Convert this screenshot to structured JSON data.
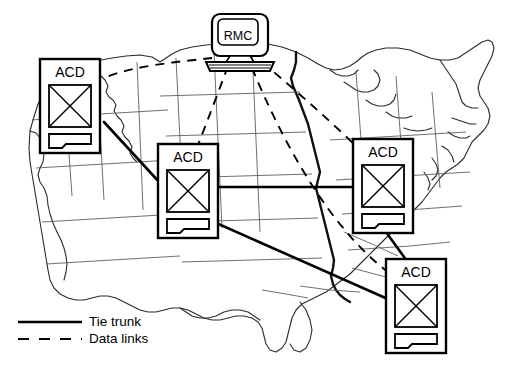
{
  "diagram": {
    "map": {
      "name": "united-states-outline",
      "outline_color": "#1a1a1a",
      "state_border_color": "#3a3a3a",
      "fill": "#ffffff"
    },
    "nodes": [
      {
        "id": "rmc",
        "label": "RMC",
        "type": "computer-workstation",
        "x": 240,
        "y": 40
      },
      {
        "id": "acd-northwest",
        "label": "ACD",
        "type": "acd-switch",
        "x": 70,
        "y": 106
      },
      {
        "id": "acd-central",
        "label": "ACD",
        "type": "acd-switch",
        "x": 188,
        "y": 191
      },
      {
        "id": "acd-northeast",
        "label": "ACD",
        "type": "acd-switch",
        "x": 383,
        "y": 186
      },
      {
        "id": "acd-southeast",
        "label": "ACD",
        "type": "acd-switch",
        "x": 416,
        "y": 306
      }
    ],
    "links": [
      {
        "from": "acd-northwest",
        "to": "acd-central",
        "kind": "tie-trunk"
      },
      {
        "from": "acd-central",
        "to": "acd-northeast",
        "kind": "tie-trunk"
      },
      {
        "from": "acd-central",
        "to": "acd-southeast",
        "kind": "tie-trunk"
      },
      {
        "from": "acd-northeast",
        "to": "acd-southeast",
        "kind": "tie-trunk"
      },
      {
        "from": "rmc",
        "to": "acd-northwest",
        "kind": "data-link"
      },
      {
        "from": "rmc",
        "to": "acd-central",
        "kind": "data-link"
      },
      {
        "from": "rmc",
        "to": "acd-northeast",
        "kind": "data-link"
      },
      {
        "from": "rmc",
        "to": "acd-southeast",
        "kind": "data-link"
      }
    ],
    "legend": {
      "items": [
        {
          "label": "Tie trunk",
          "style": "solid",
          "icon": "solid-line-icon"
        },
        {
          "label": "Data links",
          "style": "dashed",
          "icon": "dashed-line-icon"
        }
      ]
    },
    "colors": {
      "line": "#000000",
      "map_stroke": "#2b2b2b",
      "node_fill": "#ffffff"
    }
  }
}
